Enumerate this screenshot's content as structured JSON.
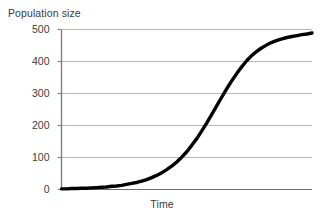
{
  "chart_data": {
    "type": "line",
    "title": "",
    "xlabel": "Time",
    "ylabel": "Population size",
    "ylim": [
      0,
      500
    ],
    "xlim": [
      0,
      100
    ],
    "yticks": [
      0,
      100,
      200,
      300,
      400,
      500
    ],
    "ytick_labels": [
      "0",
      "100",
      "200",
      "300",
      "400",
      "500"
    ],
    "xticks": [],
    "xtick_labels": [],
    "grid": "horizontal",
    "legend": "none",
    "series": [
      {
        "name": "Population size",
        "color": "#000000",
        "x": [
          0,
          2,
          4,
          6,
          8,
          10,
          12,
          14,
          16,
          18,
          20,
          22,
          24,
          26,
          28,
          30,
          32,
          34,
          36,
          38,
          40,
          42,
          44,
          46,
          48,
          50,
          52,
          54,
          56,
          58,
          60,
          62,
          64,
          66,
          68,
          70,
          72,
          74,
          76,
          78,
          80,
          82,
          84,
          86,
          88,
          90,
          92,
          94,
          96,
          98,
          100
        ],
        "values": [
          2,
          2,
          3,
          3,
          4,
          4,
          5,
          6,
          7,
          8,
          10,
          11,
          13,
          16,
          19,
          22,
          26,
          31,
          37,
          44,
          52,
          62,
          73,
          86,
          101,
          118,
          138,
          159,
          183,
          208,
          235,
          262,
          289,
          315,
          340,
          363,
          384,
          403,
          419,
          432,
          443,
          452,
          460,
          466,
          471,
          475,
          478,
          481,
          484,
          486,
          489
        ]
      }
    ],
    "annotations": []
  },
  "axes": {
    "y_axis_title": "Population size",
    "x_axis_title": "Time"
  },
  "colors": {
    "curve": "#000000",
    "gridline": "#b9b9b9",
    "axis": "#808080",
    "text": "#3a3a3a",
    "background": "#ffffff"
  }
}
